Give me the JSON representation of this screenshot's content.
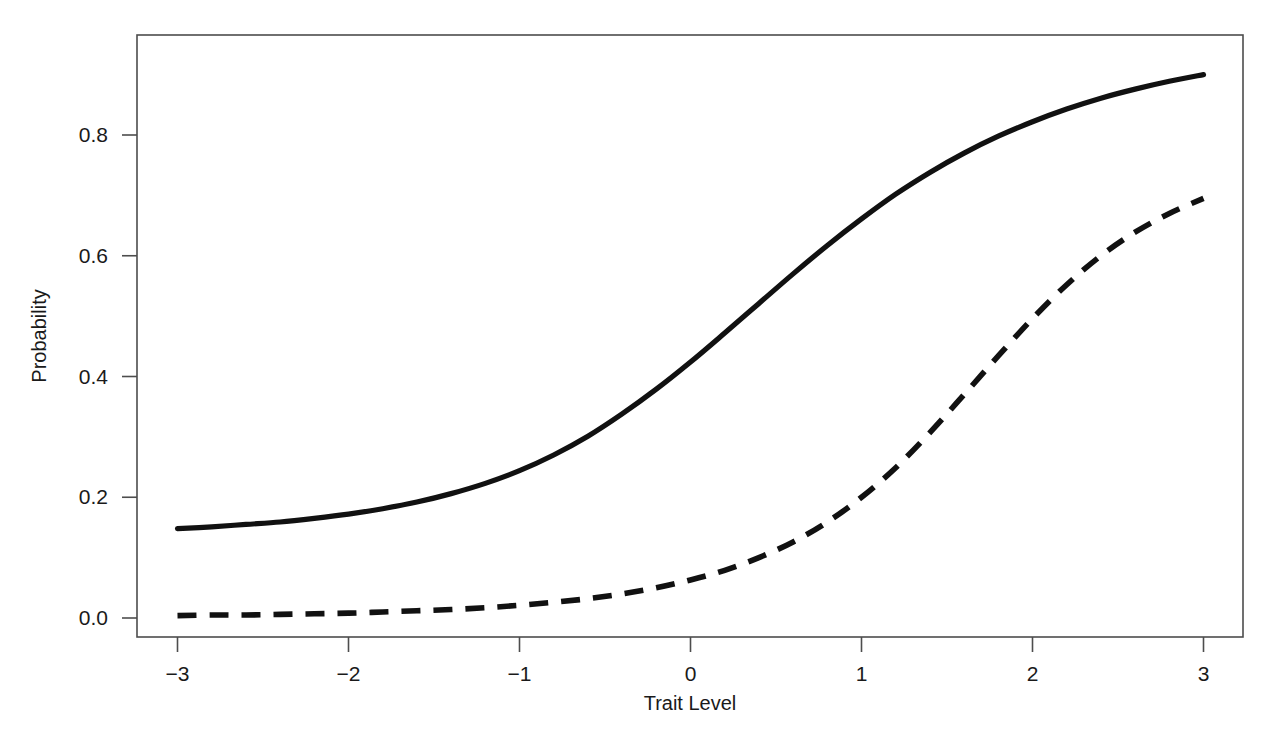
{
  "chart_data": {
    "type": "line",
    "title": "",
    "xlabel": "Trait Level",
    "ylabel": "Probability",
    "xlim": [
      -3,
      3
    ],
    "ylim": [
      0.0,
      1.0
    ],
    "grid": false,
    "legend": "none",
    "box": true,
    "xticks": [
      -3,
      -2,
      -1,
      0,
      1,
      2,
      3
    ],
    "xtick_labels": [
      "−3",
      "−2",
      "−1",
      "0",
      "1",
      "2",
      "3"
    ],
    "yticks": [
      0.0,
      0.2,
      0.4,
      0.6,
      0.8
    ],
    "ytick_labels": [
      "0.0",
      "0.2",
      "0.4",
      "0.6",
      "0.8"
    ],
    "x": [
      -3.0,
      -2.8,
      -2.6,
      -2.4,
      -2.2,
      -2.0,
      -1.8,
      -1.6,
      -1.4,
      -1.2,
      -1.0,
      -0.8,
      -0.6,
      -0.4,
      -0.2,
      0.0,
      0.2,
      0.4,
      0.6,
      0.8,
      1.0,
      1.2,
      1.4,
      1.6,
      1.8,
      2.0,
      2.2,
      2.4,
      2.6,
      2.8,
      3.0
    ],
    "series": [
      {
        "name": "solid-curve",
        "style": "solid",
        "color": "#111111",
        "values": [
          0.148,
          0.151,
          0.155,
          0.159,
          0.165,
          0.172,
          0.181,
          0.192,
          0.206,
          0.223,
          0.244,
          0.27,
          0.301,
          0.338,
          0.379,
          0.424,
          0.472,
          0.521,
          0.57,
          0.617,
          0.661,
          0.702,
          0.738,
          0.77,
          0.798,
          0.822,
          0.843,
          0.861,
          0.876,
          0.889,
          0.9
        ]
      },
      {
        "name": "dashed-curve",
        "style": "dashed",
        "color": "#111111",
        "values": [
          0.004,
          0.005,
          0.005,
          0.006,
          0.007,
          0.008,
          0.01,
          0.012,
          0.014,
          0.017,
          0.021,
          0.026,
          0.032,
          0.04,
          0.05,
          0.063,
          0.079,
          0.1,
          0.126,
          0.159,
          0.2,
          0.249,
          0.307,
          0.37,
          0.434,
          0.496,
          0.552,
          0.6,
          0.639,
          0.67,
          0.695
        ]
      }
    ],
    "annotations": []
  }
}
